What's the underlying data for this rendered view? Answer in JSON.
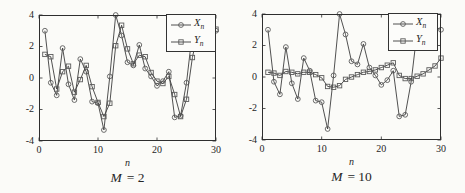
{
  "style": {
    "background": "#fbfbf8",
    "line_color": "#3d3d3d",
    "marker_color": "#5b5b5b",
    "axis_color": "#2e2e2e",
    "text_color": "#262626",
    "legend_border": "#333333",
    "legend_bg": "#fcfcfa"
  },
  "chart_data": [
    {
      "type": "line",
      "caption": {
        "var": "M",
        "rest": "= 2"
      },
      "xlabel": "n",
      "ylabel": "",
      "xlim": [
        0,
        30
      ],
      "ylim": [
        -4,
        4
      ],
      "x_ticks": [
        "0",
        "10",
        "20",
        "30"
      ],
      "y_ticks": [
        "4",
        "2",
        "0",
        "-2",
        "-4"
      ],
      "grid": false,
      "legend_position": "top-right",
      "x": [
        1,
        2,
        3,
        4,
        5,
        6,
        7,
        8,
        9,
        10,
        11,
        12,
        13,
        14,
        15,
        16,
        17,
        18,
        19,
        20,
        21,
        22,
        23,
        24,
        25,
        26,
        27,
        28,
        29,
        30
      ],
      "series": [
        {
          "name": "X",
          "sub": "n",
          "marker": "circle",
          "values": [
            3.0,
            -0.3,
            -1.1,
            1.9,
            -0.4,
            -1.4,
            1.2,
            0.4,
            -1.5,
            -1.6,
            -3.3,
            0.1,
            4.0,
            2.7,
            1.0,
            0.8,
            2.1,
            0.6,
            0.1,
            -0.5,
            -0.2,
            0.4,
            -2.5,
            -2.4,
            -0.3,
            2.9,
            3.1,
            2.7,
            3.2,
            3.0
          ]
        },
        {
          "name": "Y",
          "sub": "n",
          "marker": "square",
          "values": [
            1.5,
            1.35,
            -0.7,
            0.4,
            0.75,
            -0.9,
            -0.1,
            0.8,
            -0.55,
            -1.55,
            -2.45,
            -1.6,
            2.05,
            3.35,
            1.85,
            0.9,
            1.45,
            1.35,
            0.35,
            -0.2,
            -0.35,
            0.1,
            -1.05,
            -2.45,
            -1.35,
            1.3,
            3.0,
            2.9,
            2.95,
            3.1
          ]
        }
      ]
    },
    {
      "type": "line",
      "caption": {
        "var": "M",
        "rest": "= 10"
      },
      "xlabel": "n",
      "ylabel": "",
      "xlim": [
        0,
        30
      ],
      "ylim": [
        -4,
        4
      ],
      "x_ticks": [
        "0",
        "10",
        "20",
        "30"
      ],
      "y_ticks": [
        "4",
        "2",
        "0",
        "-2",
        "-4"
      ],
      "grid": false,
      "legend_position": "top-right",
      "x": [
        1,
        2,
        3,
        4,
        5,
        6,
        7,
        8,
        9,
        10,
        11,
        12,
        13,
        14,
        15,
        16,
        17,
        18,
        19,
        20,
        21,
        22,
        23,
        24,
        25,
        26,
        27,
        28,
        29,
        30
      ],
      "series": [
        {
          "name": "X",
          "sub": "n",
          "marker": "circle",
          "values": [
            3.0,
            -0.3,
            -1.1,
            1.9,
            -0.4,
            -1.4,
            1.2,
            0.4,
            -1.5,
            -1.6,
            -3.3,
            0.1,
            4.0,
            2.7,
            1.0,
            0.8,
            2.1,
            0.6,
            0.1,
            -0.5,
            -0.2,
            0.4,
            -2.5,
            -2.4,
            -0.3,
            2.9,
            3.1,
            2.7,
            3.2,
            3.0
          ]
        },
        {
          "name": "Y",
          "sub": "n",
          "marker": "square",
          "values": [
            0.3,
            0.25,
            0.1,
            0.35,
            0.3,
            0.2,
            0.3,
            0.3,
            0.15,
            -0.05,
            -0.6,
            -0.65,
            -0.55,
            -0.15,
            0.0,
            0.15,
            0.3,
            0.35,
            0.45,
            0.6,
            0.75,
            0.9,
            0.1,
            -0.1,
            -0.1,
            0.05,
            0.2,
            0.45,
            0.7,
            1.2
          ]
        }
      ]
    }
  ]
}
